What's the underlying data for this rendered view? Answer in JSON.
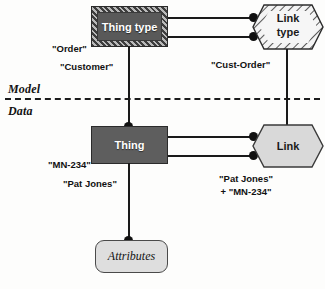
{
  "diagram": {
    "layers": [
      {
        "id": "model",
        "label": "Model"
      },
      {
        "id": "data",
        "label": "Data"
      }
    ],
    "nodes": {
      "thing_type": {
        "label": "Thing type",
        "shape": "rectangle",
        "fill": "#595959",
        "border": "hatched",
        "text_color": "#ffffff"
      },
      "link_type": {
        "label_line1": "Link",
        "label_line2": "type",
        "shape": "hexagon",
        "fill": "#f2f2f2",
        "border": "hatched",
        "text_color": "#1b1b1b"
      },
      "thing": {
        "label": "Thing",
        "shape": "rectangle",
        "fill": "#5e5e5e",
        "border": "solid",
        "text_color": "#ffffff"
      },
      "link": {
        "label": "Link",
        "shape": "hexagon",
        "fill": "#d9d9d9",
        "border": "solid",
        "text_color": "#1b1b1b"
      },
      "attributes": {
        "label": "Attributes",
        "shape": "rounded-rectangle",
        "fill": "#dedede",
        "border": "solid",
        "text_color": "#141414"
      }
    },
    "annotations": {
      "order": "\"Order\"",
      "customer": "\"Customer\"",
      "cust_order": "\"Cust-Order\"",
      "mn234": "\"MN-234\"",
      "pat_jones": "\"Pat Jones\"",
      "link_instance_line1": "\"Pat Jones\"",
      "link_instance_line2": "+ \"MN-234\""
    },
    "colors": {
      "line": "#1a1a1a",
      "divider": "#1d1d1d",
      "dot": "#111111"
    }
  }
}
